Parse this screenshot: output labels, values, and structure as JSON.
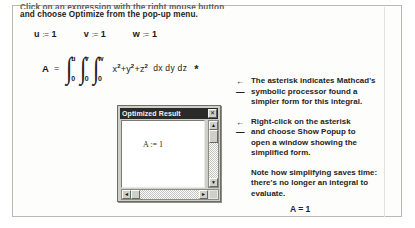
{
  "page": {
    "intro": {
      "line1": "Click on an expression with the right mouse button",
      "line2": "and choose Optimize from the pop-up menu."
    },
    "definitions": [
      {
        "var": "u",
        "assign": ":=",
        "value": "1"
      },
      {
        "var": "v",
        "assign": ":=",
        "value": "1"
      },
      {
        "var": "w",
        "assign": ":=",
        "value": "1"
      }
    ],
    "expression": {
      "lhs": "A",
      "equals": "=",
      "integrals": [
        {
          "upper": "u",
          "lower": "0"
        },
        {
          "upper": "v",
          "lower": "0"
        },
        {
          "upper": "w",
          "lower": "0"
        }
      ],
      "integrand_terms": [
        {
          "base": "x",
          "power": "2"
        },
        {
          "base": "y",
          "power": "2"
        },
        {
          "base": "z",
          "power": "2"
        }
      ],
      "plus": "+",
      "differentials": "dx dy dz",
      "asterisk": "*"
    },
    "popup": {
      "title": "Optimized Result",
      "close_label": "✕",
      "result": "A := 1",
      "vscroll": {
        "up": "▲",
        "down": "▼"
      },
      "hscroll": {
        "left": "◄",
        "right": "►"
      }
    },
    "notes": [
      {
        "arrow": "←",
        "lines": [
          "The asterisk indicates Mathcad's",
          "symbolic processor found a",
          "simpler form for this integral."
        ]
      },
      {
        "arrow": "←",
        "lines": [
          "Right-click on the asterisk",
          "and choose Show Popup to",
          "open a window showing the",
          "simplified form."
        ]
      },
      {
        "arrow": "",
        "lines": [
          "Note how simplifying saves time:",
          "there's no longer an integral to",
          "evaluate."
        ]
      }
    ],
    "final_result": "A = 1"
  }
}
